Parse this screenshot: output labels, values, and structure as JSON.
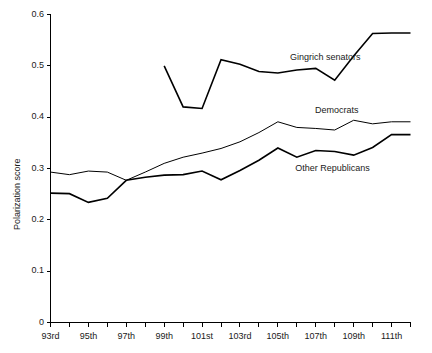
{
  "chart_data": {
    "type": "line",
    "title": "",
    "xlabel": "",
    "ylabel": "Polarization score",
    "ylim": [
      0,
      0.6
    ],
    "yticks": [
      0,
      0.1,
      0.2,
      0.3,
      0.4,
      0.5,
      0.6
    ],
    "ytick_labels": [
      "0",
      "0.1",
      "0.2",
      "0.3",
      "0.4",
      "0.5",
      "0.6"
    ],
    "grid": false,
    "legend_position": "inline-annotations",
    "x": [
      "93rd",
      "94th",
      "95th",
      "96th",
      "97th",
      "98th",
      "99th",
      "100th",
      "101st",
      "102nd",
      "103rd",
      "104th",
      "105th",
      "106th",
      "107th",
      "108th",
      "109th",
      "110th",
      "111th",
      "112th"
    ],
    "xtick_labels": [
      "93rd",
      "",
      "95th",
      "",
      "97th",
      "",
      "99th",
      "",
      "101st",
      "",
      "103rd",
      "",
      "105th",
      "",
      "107th",
      "",
      "109th",
      "",
      "111th",
      ""
    ],
    "series": [
      {
        "name": "Gingrich senators",
        "color": "#000000",
        "line_width": 1.6,
        "values": [
          null,
          null,
          null,
          null,
          null,
          null,
          0.5,
          0.42,
          0.417,
          0.512,
          0.503,
          0.489,
          0.486,
          0.492,
          0.495,
          0.472,
          0.519,
          0.563,
          0.564,
          0.564
        ]
      },
      {
        "name": "Democrats",
        "color": "#000000",
        "line_width": 1.0,
        "values": [
          0.293,
          0.288,
          0.295,
          0.293,
          0.277,
          0.293,
          0.31,
          0.322,
          0.33,
          0.339,
          0.352,
          0.37,
          0.391,
          0.38,
          0.378,
          0.375,
          0.394,
          0.387,
          0.391,
          0.391
        ]
      },
      {
        "name": "Other Republicans",
        "color": "#000000",
        "line_width": 1.6,
        "values": [
          0.252,
          0.251,
          0.234,
          0.242,
          0.277,
          0.283,
          0.287,
          0.288,
          0.295,
          0.278,
          0.296,
          0.316,
          0.34,
          0.322,
          0.335,
          0.333,
          0.326,
          0.341,
          0.366,
          0.366
        ]
      }
    ],
    "annotations": [
      {
        "text": "Gingrich senators",
        "x_pct": 66.5,
        "y_value": 0.515
      },
      {
        "text": "Democrats",
        "x_pct": 73.5,
        "y_value": 0.412
      },
      {
        "text": "Other Republicans",
        "x_pct": 68.0,
        "y_value": 0.3
      }
    ]
  }
}
